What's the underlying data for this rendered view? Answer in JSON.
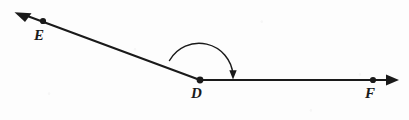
{
  "figure": {
    "type": "geometry-diagram",
    "background_color": "#fdfdfd",
    "stroke_color": "#1a1a1a",
    "labels": {
      "vertex": "D",
      "ray_end_left": "E",
      "ray_end_right": "F"
    },
    "points": {
      "D": {
        "x": 200,
        "y": 80
      },
      "E": {
        "x": 43,
        "y": 21
      },
      "F": {
        "x": 373,
        "y": 80
      }
    },
    "rays": [
      {
        "name": "ray-DE",
        "from": "D",
        "through": "E",
        "arrow_tip": {
          "x": 16,
          "y": 13
        },
        "direction": "up-left"
      },
      {
        "name": "ray-DF",
        "from": "D",
        "through": "F",
        "arrow_tip": {
          "x": 398,
          "y": 80
        },
        "direction": "right"
      }
    ],
    "angle_arc": {
      "name": "angle-arc-EDF",
      "center": "D",
      "radius": 33,
      "start": {
        "x": 172,
        "y": 62
      },
      "end": {
        "x": 233,
        "y": 76
      },
      "arrow_direction": "down",
      "sweep": "from ray DE clockwise to ray DF"
    }
  }
}
